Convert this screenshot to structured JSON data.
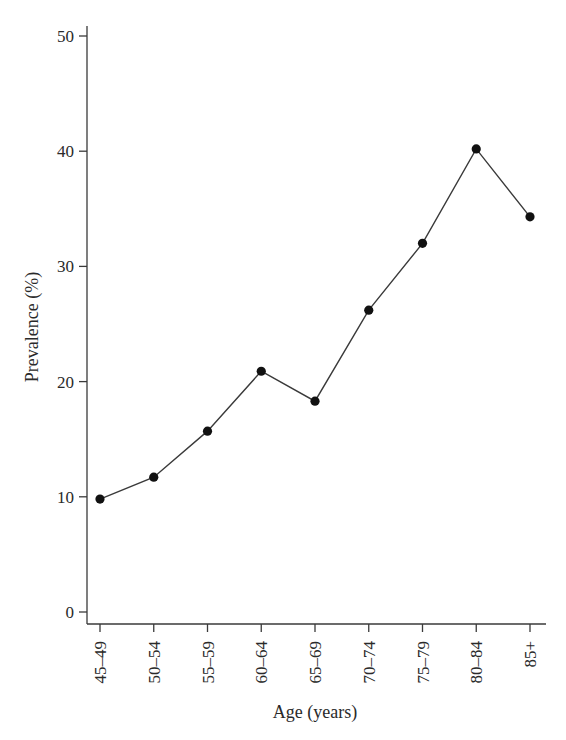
{
  "chart_data": {
    "type": "line",
    "title": "",
    "xlabel": "Age (years)",
    "ylabel": "Prevalence (%)",
    "categories": [
      "45–49",
      "50–54",
      "55–59",
      "60–64",
      "65–69",
      "70–74",
      "75–79",
      "80–84",
      "85+"
    ],
    "series": [
      {
        "name": "Prevalence",
        "values": [
          9.8,
          11.7,
          15.7,
          20.9,
          18.3,
          26.2,
          32.0,
          40.2,
          34.3
        ]
      }
    ],
    "ylim": [
      0,
      50
    ],
    "yticks": [
      0,
      10,
      20,
      30,
      40,
      50
    ],
    "grid": false,
    "legend": "none",
    "marker": "filled-circle",
    "colors": {
      "line": "#3a3a3a",
      "marker": "#111111",
      "axis": "#3a3a3a",
      "text": "#2a2a2a"
    }
  }
}
